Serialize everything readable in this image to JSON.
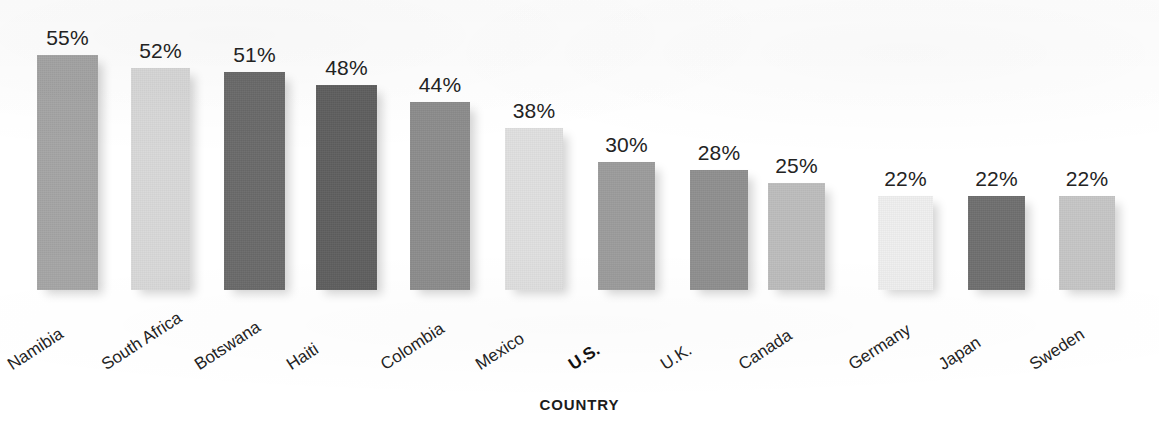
{
  "chart_data": {
    "type": "bar",
    "title": "",
    "subtitle": "",
    "xlabel": "COUNTRY",
    "ylabel": "",
    "ylim": [
      0,
      55
    ],
    "grid": false,
    "legend": null,
    "orientation": "vertical",
    "value_suffix": "%",
    "categories": [
      "Namibia",
      "South Africa",
      "Botswana",
      "Haiti",
      "Colombia",
      "Mexico",
      "U.S.",
      "U.K.",
      "Canada",
      "Germany",
      "Japan",
      "Sweden"
    ],
    "values": [
      55,
      52,
      51,
      48,
      44,
      38,
      30,
      28,
      25,
      22,
      22,
      22
    ],
    "value_labels": [
      "55%",
      "52%",
      "51%",
      "48%",
      "44%",
      "38%",
      "30%",
      "28%",
      "25%",
      "22%",
      "22%",
      "22%"
    ],
    "bar_colors": [
      "#a5a5a5",
      "#d9d9d9",
      "#6a6a6a",
      "#5f5f5f",
      "#8c8c8c",
      "#e0e0e0",
      "#9c9c9c",
      "#8f8f8f",
      "#bdbdbd",
      "#efefef",
      "#6f6f6f",
      "#c6c6c6"
    ],
    "highlight_category": "U.S.",
    "bars": [
      {
        "label": "Namibia",
        "value": 55,
        "value_label": "55%",
        "color": "#a5a5a5",
        "left": 37,
        "width": 61,
        "highlight": false
      },
      {
        "label": "South Africa",
        "value": 52,
        "value_label": "52%",
        "color": "#d9d9d9",
        "left": 131,
        "width": 59,
        "highlight": false
      },
      {
        "label": "Botswana",
        "value": 51,
        "value_label": "51%",
        "color": "#6a6a6a",
        "left": 224,
        "width": 61,
        "highlight": false
      },
      {
        "label": "Haiti",
        "value": 48,
        "value_label": "48%",
        "color": "#5f5f5f",
        "left": 316,
        "width": 61,
        "highlight": false
      },
      {
        "label": "Colombia",
        "value": 44,
        "value_label": "44%",
        "color": "#8c8c8c",
        "left": 410,
        "width": 60,
        "highlight": false
      },
      {
        "label": "Mexico",
        "value": 38,
        "value_label": "38%",
        "color": "#e0e0e0",
        "left": 505,
        "width": 58,
        "highlight": false
      },
      {
        "label": "U.S.",
        "value": 30,
        "value_label": "30%",
        "color": "#9c9c9c",
        "left": 598,
        "width": 57,
        "highlight": true
      },
      {
        "label": "U.K.",
        "value": 28,
        "value_label": "28%",
        "color": "#8f8f8f",
        "left": 690,
        "width": 58,
        "highlight": false
      },
      {
        "label": "Canada",
        "value": 25,
        "value_label": "25%",
        "color": "#bdbdbd",
        "left": 768,
        "width": 57,
        "highlight": false
      },
      {
        "label": "Germany",
        "value": 22,
        "value_label": "22%",
        "color": "#efefef",
        "left": 878,
        "width": 55,
        "highlight": false
      },
      {
        "label": "Japan",
        "value": 22,
        "value_label": "22%",
        "color": "#6f6f6f",
        "left": 968,
        "width": 57,
        "highlight": false
      },
      {
        "label": "Sweden",
        "value": 22,
        "value_label": "22%",
        "color": "#c6c6c6",
        "left": 1059,
        "width": 56,
        "highlight": false
      }
    ]
  },
  "axis": {
    "x_title": "COUNTRY"
  },
  "scale": {
    "baseline_y": 290,
    "pixels_per_unit": 4.27
  }
}
